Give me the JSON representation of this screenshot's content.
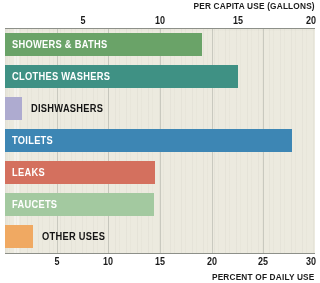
{
  "chart_data": {
    "type": "bar",
    "orientation": "horizontal",
    "title": "",
    "categories": [
      "SHOWERS & BATHS",
      "CLOTHES WASHERS",
      "DISHWASHERS",
      "TOILETS",
      "LEAKS",
      "FAUCETS",
      "OTHER USES"
    ],
    "values": [
      12.7,
      15.0,
      1.1,
      18.5,
      9.7,
      9.6,
      1.8
    ],
    "percent_values": [
      19.0,
      22.5,
      1.6,
      27.7,
      14.5,
      14.4,
      2.7
    ],
    "xlabel": "PER CAPITA USE (GALLONS)",
    "xlabel_secondary": "PERCENT OF DAILY USE",
    "ylabel": "",
    "xlim": [
      0,
      20
    ],
    "xlim_secondary": [
      0,
      30
    ],
    "top_ticks": [
      "5",
      "10",
      "15",
      "20"
    ],
    "top_tick_values": [
      5,
      10,
      15,
      20
    ],
    "bottom_ticks": [
      "5",
      "10",
      "15",
      "20",
      "25",
      "30"
    ],
    "bottom_tick_values": [
      5,
      10,
      15,
      20,
      25,
      30
    ],
    "grid": true,
    "legend": "none",
    "bar_colors": [
      "#6aa368",
      "#3f9184",
      "#aeabd0",
      "#3d86b4",
      "#d4705e",
      "#a3c9a0",
      "#f0a962"
    ],
    "label_placement": [
      "inside",
      "inside",
      "outside",
      "inside",
      "inside",
      "inside",
      "outside"
    ],
    "plot_background": "#eceadf",
    "gridline_color": "#787d76",
    "axis_rule_color": "#8d9089"
  },
  "axes": {
    "top_title": "PER CAPITA USE (GALLONS)",
    "bottom_title": "PERCENT OF DAILY USE"
  }
}
